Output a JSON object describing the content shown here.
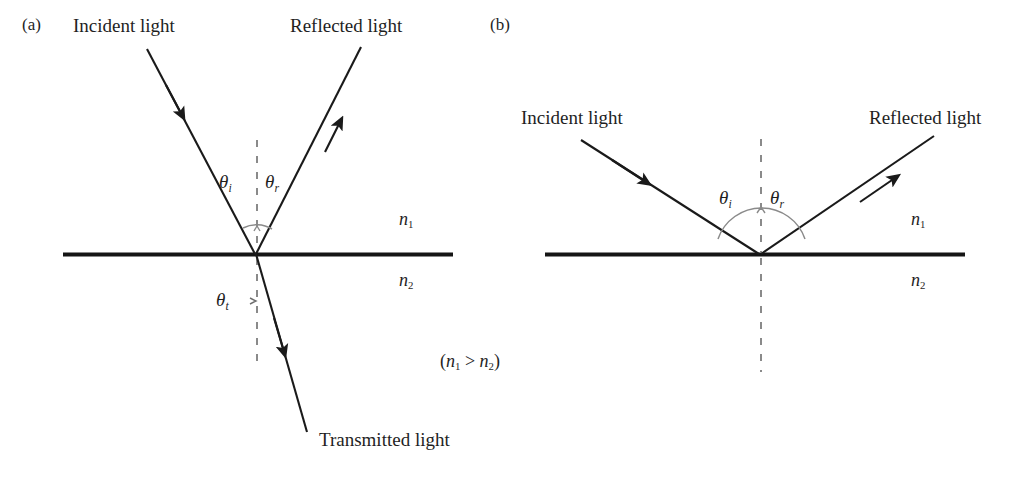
{
  "figure": {
    "width": 1021,
    "height": 484,
    "background": "#ffffff",
    "ink_color": "#1a1a1a",
    "dash_color": "#8a8a8a"
  },
  "panels": [
    {
      "tag": "(a)",
      "rays": [
        {
          "name": "incident",
          "label": "Incident light"
        },
        {
          "name": "reflected",
          "label": "Reflected light"
        },
        {
          "name": "transmitted",
          "label": "Transmitted light"
        }
      ],
      "angles": [
        {
          "name": "theta-incident",
          "symbol": "θ",
          "subscript": "i"
        },
        {
          "name": "theta-reflected",
          "symbol": "θ",
          "subscript": "r"
        },
        {
          "name": "theta-transmitted",
          "symbol": "θ",
          "subscript": "t"
        }
      ],
      "media": [
        {
          "name": "upper-medium",
          "symbol": "n",
          "subscript": "1"
        },
        {
          "name": "lower-medium",
          "symbol": "n",
          "subscript": "2"
        }
      ],
      "condition": {
        "open": "(",
        "symbol_a": "n",
        "sub_a": "1",
        "operator": " > ",
        "symbol_b": "n",
        "sub_b": "2",
        "close": ")"
      }
    },
    {
      "tag": "(b)",
      "rays": [
        {
          "name": "incident",
          "label": "Incident light"
        },
        {
          "name": "reflected",
          "label": "Reflected light"
        }
      ],
      "angles": [
        {
          "name": "theta-incident",
          "symbol": "θ",
          "subscript": "i"
        },
        {
          "name": "theta-reflected",
          "symbol": "θ",
          "subscript": "r"
        }
      ],
      "media": [
        {
          "name": "upper-medium",
          "symbol": "n",
          "subscript": "1"
        },
        {
          "name": "lower-medium",
          "symbol": "n",
          "subscript": "2"
        }
      ]
    }
  ]
}
